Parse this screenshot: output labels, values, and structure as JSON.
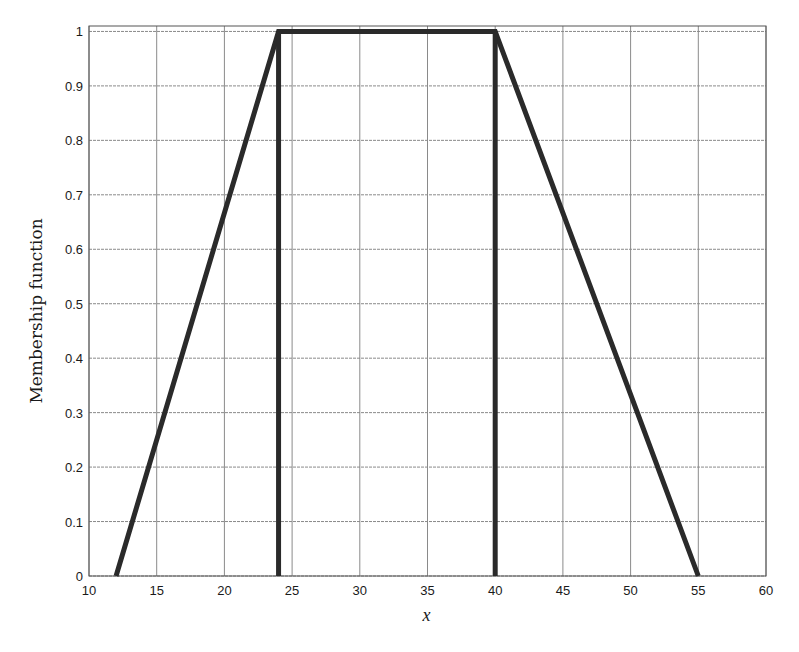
{
  "chart_data": {
    "type": "line",
    "title": "",
    "xlabel": "x",
    "ylabel": "Membership function",
    "xlim": [
      10,
      60
    ],
    "ylim": [
      0,
      1.01
    ],
    "xticks": [
      10,
      15,
      20,
      25,
      30,
      35,
      40,
      45,
      50,
      55,
      60
    ],
    "yticks": [
      0,
      0.1,
      0.2,
      0.3,
      0.4,
      0.5,
      0.6,
      0.7,
      0.8,
      0.9,
      1
    ],
    "ytick_labels": [
      "0",
      "0.1",
      "0.2",
      "0.3",
      "0.4",
      "0.5",
      "0.6",
      "0.7",
      "0.8",
      "0.9",
      "1"
    ],
    "grid": true,
    "legend": null,
    "series": [
      {
        "name": "trapezoidal membership function",
        "x": [
          12,
          24,
          40,
          55
        ],
        "y": [
          0,
          1,
          1,
          0
        ],
        "color": "#2a2a2a"
      },
      {
        "name": "vertical line at x=24",
        "x": [
          24,
          24
        ],
        "y": [
          0,
          1
        ],
        "color": "#2a2a2a"
      },
      {
        "name": "vertical line at x=40",
        "x": [
          40,
          40
        ],
        "y": [
          0,
          1
        ],
        "color": "#2a2a2a"
      }
    ]
  },
  "layout": {
    "plot_left": 89,
    "plot_top": 26,
    "plot_right": 766,
    "plot_bottom": 576
  }
}
